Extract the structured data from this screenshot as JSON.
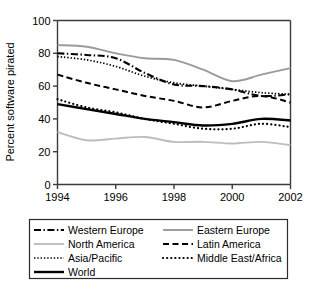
{
  "chart_data": {
    "type": "line",
    "title": "",
    "xlabel": "",
    "ylabel": "Percent software pirated",
    "xlim": [
      1994,
      2002
    ],
    "ylim": [
      0,
      100
    ],
    "yticks": [
      0,
      20,
      40,
      60,
      80,
      100
    ],
    "xticks": [
      1994,
      1996,
      1998,
      2000,
      2002
    ],
    "xtick_labels": [
      "1994",
      "1996",
      "1998",
      "2000",
      "2002"
    ],
    "ytick_labels": [
      "0",
      "20",
      "40",
      "60",
      "80",
      "100"
    ],
    "grid": false,
    "legend_position": "below",
    "x": [
      1994,
      1995,
      1996,
      1997,
      1998,
      1999,
      2000,
      2001,
      2002
    ],
    "series": [
      {
        "name": "Western Europe",
        "style": "dash-dot",
        "color": "#000000",
        "values": [
          80,
          79,
          77,
          68,
          61,
          60,
          58,
          54,
          55
        ]
      },
      {
        "name": "Eastern Europe",
        "style": "solid",
        "color": "#9a9a9a",
        "values": [
          85,
          84,
          80,
          77,
          76,
          70,
          63,
          67,
          71
        ]
      },
      {
        "name": "North America",
        "style": "solid",
        "color": "#bdbdbd",
        "values": [
          32,
          27,
          28,
          29,
          26,
          26,
          25,
          26,
          24
        ]
      },
      {
        "name": "Latin America",
        "style": "dashed",
        "color": "#000000",
        "values": [
          67,
          62,
          58,
          54,
          51,
          47,
          51,
          54,
          50
        ]
      },
      {
        "name": "Asia/Pacific",
        "style": "dotted",
        "color": "#000000",
        "values": [
          78,
          76,
          72,
          66,
          62,
          60,
          58,
          56,
          55
        ]
      },
      {
        "name": "Middle East/Africa",
        "style": "dotted-round",
        "color": "#000000",
        "values": [
          52,
          47,
          44,
          40,
          37,
          34,
          34,
          37,
          35
        ]
      },
      {
        "name": "World",
        "style": "solid-thick",
        "color": "#000000",
        "values": [
          49,
          46,
          43,
          40,
          38,
          36,
          37,
          40,
          39
        ]
      }
    ]
  },
  "axis": {
    "y_title": "Percent software pirated"
  },
  "legend": {
    "entries": [
      {
        "label": "Western Europe",
        "style": "dash-dot",
        "color": "#000000"
      },
      {
        "label": "Eastern Europe",
        "style": "solid",
        "color": "#9a9a9a"
      },
      {
        "label": "North America",
        "style": "solid",
        "color": "#bdbdbd"
      },
      {
        "label": "Latin America",
        "style": "dashed",
        "color": "#000000"
      },
      {
        "label": "Asia/Pacific",
        "style": "dotted",
        "color": "#000000"
      },
      {
        "label": "Middle East/Africa",
        "style": "dotted-round",
        "color": "#000000"
      },
      {
        "label": "World",
        "style": "solid-thick",
        "color": "#000000"
      }
    ]
  },
  "caption": {
    "text": ""
  },
  "colors": {
    "axis": "#3b3b3b",
    "gray_line": "#9a9a9a",
    "light_gray_line": "#bdbdbd",
    "black_line": "#000000",
    "background": "#ffffff"
  }
}
